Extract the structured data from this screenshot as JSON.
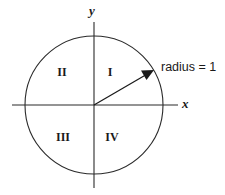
{
  "figure": {
    "background_color": "#ffffff",
    "line_color": "#2b2b2b",
    "text_color": "#1a1a1a"
  },
  "axes": {
    "x_label": "x",
    "y_label": "y",
    "origin": {
      "x": 94,
      "y": 105
    },
    "x_extent": [
      12,
      178
    ],
    "y_extent": [
      22,
      188
    ]
  },
  "circle": {
    "center_x": 94,
    "center_y": 105,
    "radius_px": 69,
    "radius_value": "1"
  },
  "quadrants": [
    {
      "name": "quadrant-1",
      "label": "I",
      "x": 110,
      "y": 73
    },
    {
      "name": "quadrant-2",
      "label": "II",
      "x": 62,
      "y": 73
    },
    {
      "name": "quadrant-3",
      "label": "III",
      "x": 63,
      "y": 138
    },
    {
      "name": "quadrant-4",
      "label": "IV",
      "x": 112,
      "y": 138
    }
  ],
  "annotation": {
    "radius_text": "radius = 1",
    "text_x": 161,
    "text_y": 68,
    "arrow_from": {
      "x": 94,
      "y": 105
    },
    "arrow_to": {
      "x": 154,
      "y": 70
    }
  }
}
